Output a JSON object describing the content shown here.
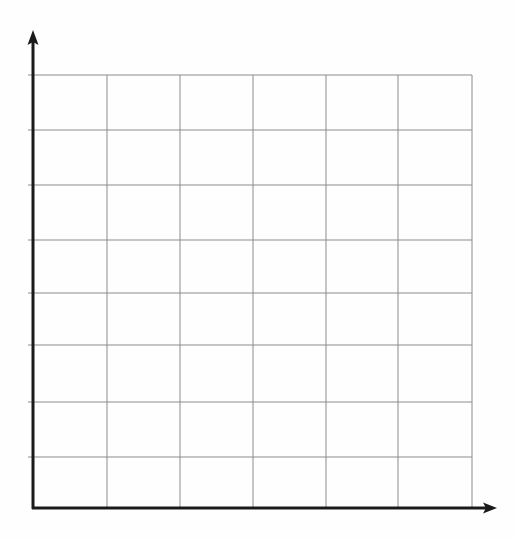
{
  "figure": {
    "title": "",
    "subtitle": "",
    "background_color": "#fefefe",
    "width": 515,
    "height": 538,
    "style": "hand-drawn blank graph paper"
  },
  "axes": {
    "x_axis": {
      "name": "x-axis",
      "label": "",
      "color": "#1a1a1a",
      "stroke_width": 3,
      "origin_x": 33,
      "origin_y": 508,
      "end_x": 497,
      "arrowhead": "right",
      "tick_labels": []
    },
    "y_axis": {
      "name": "y-axis",
      "label": "",
      "color": "#1a1a1a",
      "stroke_width": 3,
      "origin_x": 33,
      "origin_y": 508,
      "end_y": 30,
      "arrowhead": "up",
      "tick_labels": []
    }
  },
  "chart_data": {
    "type": "line",
    "title": "",
    "subtitle": "",
    "xlabel": "",
    "ylabel": "",
    "series": [],
    "categories": [],
    "x": [],
    "values": [],
    "annotations": [],
    "legend": {
      "visible": false,
      "position": "none",
      "entries": []
    },
    "grid": {
      "visible": true,
      "color": "#8c8c8c",
      "stroke_width": 1,
      "columns": 6,
      "rows": 8,
      "vertical_lines_x": [
        33,
        107,
        180,
        253,
        326,
        398,
        472
      ],
      "horizontal_lines_y": [
        75,
        130,
        185,
        240,
        293,
        345,
        402,
        457,
        508
      ],
      "cell_width": 73,
      "cell_height": 54,
      "plot_left": 33,
      "plot_right": 472,
      "plot_top": 75,
      "plot_bottom": 508
    },
    "xlim": [
      0,
      6
    ],
    "ylim": [
      0,
      8
    ],
    "xticks": [],
    "yticks": [],
    "data_points_present": false,
    "note": "Empty coordinate grid with no plotted data, no tick labels and no axis titles"
  },
  "colors": {
    "axis": "#1a1a1a",
    "grid": "#8c8c8c",
    "background": "#fefefe"
  }
}
